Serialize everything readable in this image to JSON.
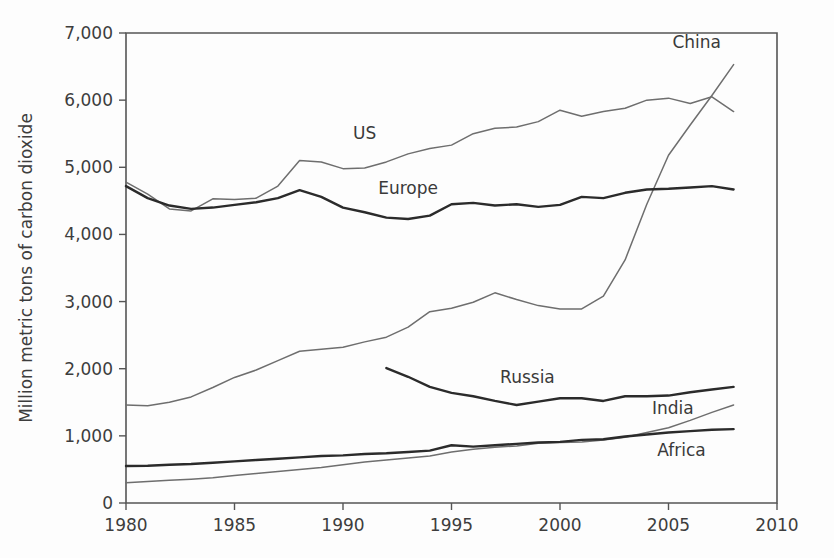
{
  "chart_data": {
    "type": "line",
    "title": "",
    "xlabel": "",
    "ylabel": "Million metric tons of carbon dioxide",
    "xlim": [
      1980,
      2010
    ],
    "ylim": [
      0,
      7000
    ],
    "grid": false,
    "legend_position": "inline-labels",
    "x_ticks": [
      "1980",
      "1985",
      "1990",
      "1995",
      "2000",
      "2005",
      "2010"
    ],
    "y_ticks": [
      "0",
      "1,000",
      "2,000",
      "3,000",
      "4,000",
      "5,000",
      "6,000",
      "7,000"
    ],
    "series": [
      {
        "name": "China",
        "color": "#6e6e6e",
        "width": 1.5,
        "label_x": 2006.3,
        "label_y": 6780,
        "x": [
          1980,
          1981,
          1982,
          1983,
          1984,
          1985,
          1986,
          1987,
          1988,
          1989,
          1990,
          1991,
          1992,
          1993,
          1994,
          1995,
          1996,
          1997,
          1998,
          1999,
          2000,
          2001,
          2002,
          2003,
          2004,
          2005,
          2006,
          2007,
          2008
        ],
        "values": [
          1460,
          1450,
          1500,
          1580,
          1720,
          1870,
          1980,
          2120,
          2260,
          2290,
          2320,
          2400,
          2470,
          2620,
          2850,
          2900,
          2990,
          3130,
          3030,
          2940,
          2890,
          2890,
          3080,
          3620,
          4450,
          5180,
          5630,
          6070,
          6530
        ]
      },
      {
        "name": "US",
        "color": "#6e6e6e",
        "width": 1.5,
        "label_x": 1991.0,
        "label_y": 5420,
        "x": [
          1980,
          1981,
          1982,
          1983,
          1984,
          1985,
          1986,
          1987,
          1988,
          1989,
          1990,
          1991,
          1992,
          1993,
          1994,
          1995,
          1996,
          1997,
          1998,
          1999,
          2000,
          2001,
          2002,
          2003,
          2004,
          2005,
          2006,
          2007,
          2008
        ],
        "values": [
          4780,
          4600,
          4380,
          4350,
          4530,
          4520,
          4540,
          4720,
          5100,
          5080,
          4980,
          4990,
          5080,
          5200,
          5280,
          5330,
          5500,
          5580,
          5600,
          5680,
          5850,
          5760,
          5830,
          5880,
          6000,
          6030,
          5950,
          6050,
          5830
        ]
      },
      {
        "name": "Europe",
        "color": "#2b2b2b",
        "width": 2.4,
        "label_x": 1993.0,
        "label_y": 4600,
        "x": [
          1980,
          1981,
          1982,
          1983,
          1984,
          1985,
          1986,
          1987,
          1988,
          1989,
          1990,
          1991,
          1992,
          1993,
          1994,
          1995,
          1996,
          1997,
          1998,
          1999,
          2000,
          2001,
          2002,
          2003,
          2004,
          2005,
          2006,
          2007,
          2008
        ],
        "values": [
          4720,
          4540,
          4430,
          4380,
          4400,
          4440,
          4480,
          4540,
          4660,
          4560,
          4400,
          4330,
          4250,
          4230,
          4280,
          4450,
          4470,
          4430,
          4450,
          4410,
          4440,
          4560,
          4540,
          4620,
          4670,
          4680,
          4700,
          4720,
          4670
        ]
      },
      {
        "name": "Russia",
        "color": "#2b2b2b",
        "width": 2.4,
        "label_x": 1998.5,
        "label_y": 1790,
        "x": [
          1992,
          1993,
          1994,
          1995,
          1996,
          1997,
          1998,
          1999,
          2000,
          2001,
          2002,
          2003,
          2004,
          2005,
          2006,
          2007,
          2008
        ],
        "values": [
          2010,
          1880,
          1730,
          1640,
          1590,
          1520,
          1460,
          1510,
          1560,
          1560,
          1520,
          1590,
          1590,
          1600,
          1650,
          1690,
          1730
        ]
      },
      {
        "name": "India",
        "color": "#6e6e6e",
        "width": 1.5,
        "label_x": 2005.2,
        "label_y": 1320,
        "x": [
          1980,
          1981,
          1982,
          1983,
          1984,
          1985,
          1986,
          1987,
          1988,
          1989,
          1990,
          1991,
          1992,
          1993,
          1994,
          1995,
          1996,
          1997,
          1998,
          1999,
          2000,
          2001,
          2002,
          2003,
          2004,
          2005,
          2006,
          2007,
          2008
        ],
        "values": [
          300,
          320,
          340,
          355,
          375,
          410,
          440,
          470,
          500,
          530,
          570,
          610,
          640,
          670,
          700,
          760,
          800,
          830,
          850,
          890,
          900,
          910,
          940,
          980,
          1050,
          1120,
          1230,
          1350,
          1460
        ]
      },
      {
        "name": "Africa",
        "color": "#2b2b2b",
        "width": 2.4,
        "label_x": 2005.6,
        "label_y": 700,
        "x": [
          1980,
          1981,
          1982,
          1983,
          1984,
          1985,
          1986,
          1987,
          1988,
          1989,
          1990,
          1991,
          1992,
          1993,
          1994,
          1995,
          1996,
          1997,
          1998,
          1999,
          2000,
          2001,
          2002,
          2003,
          2004,
          2005,
          2006,
          2007,
          2008
        ],
        "values": [
          550,
          555,
          570,
          580,
          600,
          620,
          640,
          660,
          680,
          700,
          710,
          730,
          740,
          760,
          780,
          860,
          840,
          860,
          880,
          900,
          910,
          940,
          950,
          990,
          1020,
          1050,
          1070,
          1090,
          1100
        ]
      }
    ]
  }
}
